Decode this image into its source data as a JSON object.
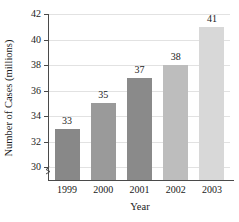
{
  "chart_data": {
    "type": "bar",
    "title": "",
    "xlabel": "Year",
    "ylabel": "Number of Cases (millions)",
    "categories": [
      "1999",
      "2000",
      "2001",
      "2002",
      "2003"
    ],
    "values": [
      33,
      35,
      37,
      38,
      41
    ],
    "data_labels": [
      "33",
      "35",
      "37",
      "38",
      "41"
    ],
    "ylim": [
      29,
      42
    ],
    "yticks": [
      30,
      32,
      34,
      36,
      38,
      40,
      42
    ],
    "ytick_labels": [
      "30",
      "32",
      "34",
      "36",
      "38",
      "40",
      "42"
    ],
    "grid": "horizontal",
    "axis_break": true,
    "legend": "none",
    "bar_colors": [
      "#888888",
      "#9a9a9a",
      "#8a8a8a",
      "#bdbdbd",
      "#d8d8d8"
    ],
    "axis_color": "#4a4a4a",
    "grid_color": "#e2e2e2",
    "background": "#ffffff"
  }
}
